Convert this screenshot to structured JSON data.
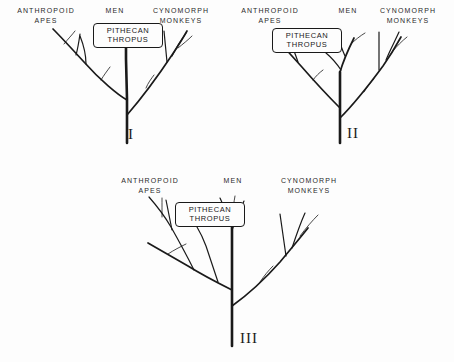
{
  "figure": {
    "background_color": "#fdfdfd",
    "line_color": "#1a1a1a",
    "taxa": {
      "apes": "ANTHROPOID\nAPES",
      "men": "MEN",
      "monkeys": "CYNOMORPH\nMONKEYS"
    },
    "fossil_label": "PITHECAN\nTHROPUS"
  },
  "panels": [
    {
      "id": "I",
      "numeral": "I",
      "labels": {
        "apes": "ANTHROPOID\nAPES",
        "men": "MEN",
        "monkeys": "CYNOMORPH\nMONKEYS"
      },
      "fossil_box": "PITHECAN\nTHROPUS"
    },
    {
      "id": "II",
      "numeral": "II",
      "labels": {
        "apes": "ANTHROPOID\nAPES",
        "men": "MEN",
        "monkeys": "CYNOMORPH\nMONKEYS"
      },
      "fossil_box": "PITHECAN\nTHROPUS"
    },
    {
      "id": "III",
      "numeral": "III",
      "labels": {
        "apes": "ANTHROPOID\nAPES",
        "men": "MEN",
        "monkeys": "CYNOMORPH\nMONKEYS"
      },
      "fossil_box": "PITHECAN\nTHROPUS"
    }
  ]
}
